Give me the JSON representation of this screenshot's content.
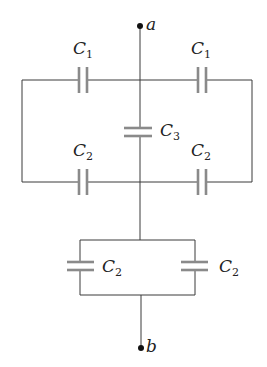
{
  "diagram": {
    "type": "capacitor circuit",
    "terminals": [
      {
        "id": "a",
        "label": "a"
      },
      {
        "id": "b",
        "label": "b"
      }
    ],
    "capacitors": [
      {
        "id": "c1-left",
        "symbol": "C",
        "subscript": "1"
      },
      {
        "id": "c1-right",
        "symbol": "C",
        "subscript": "1"
      },
      {
        "id": "c3",
        "symbol": "C",
        "subscript": "3"
      },
      {
        "id": "c2-upper-left",
        "symbol": "C",
        "subscript": "2"
      },
      {
        "id": "c2-upper-right",
        "symbol": "C",
        "subscript": "2"
      },
      {
        "id": "c2-lower-left",
        "symbol": "C",
        "subscript": "2"
      },
      {
        "id": "c2-lower-right",
        "symbol": "C",
        "subscript": "2"
      }
    ],
    "colors": {
      "wire": "#3a3a3a",
      "plate": "#8a8a8a",
      "terminal": "#111111"
    }
  }
}
